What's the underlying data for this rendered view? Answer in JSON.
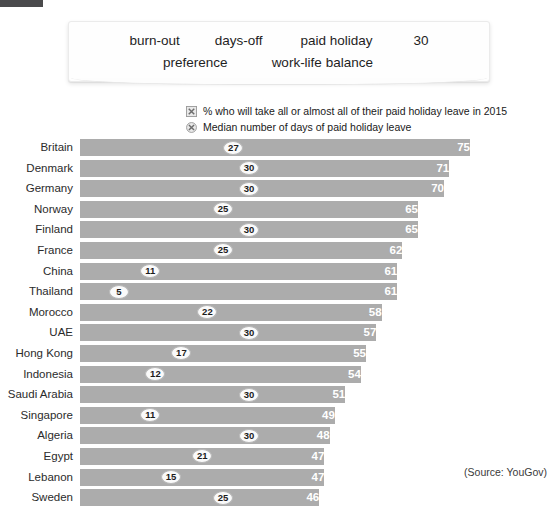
{
  "top_strip": {
    "color": "#4a4a4c"
  },
  "keyword_card": {
    "row1": [
      "burn-out",
      "days-off",
      "paid holiday",
      "30"
    ],
    "row2": [
      "preference",
      "work-life balance"
    ]
  },
  "legend": [
    {
      "marker": "broken-image-square-icon",
      "label": "% who will take all or almost all of their paid holiday leave in 2015"
    },
    {
      "marker": "broken-image-circle-icon",
      "label": "Median number of days of paid holiday leave"
    }
  ],
  "source": "(Source: YouGov)",
  "colors": {
    "bar": "#acacac",
    "bar_value_text": "#ffffff",
    "badge_fill": "#fafafa",
    "badge_border": "#b9b9b9"
  },
  "chart_data": {
    "type": "bar",
    "title": "",
    "xlabel": "",
    "ylabel": "",
    "orientation": "horizontal",
    "grid": false,
    "legend_position": "top-right",
    "xlim": [
      0,
      80
    ],
    "categories": [
      "Britain",
      "Denmark",
      "Germany",
      "Norway",
      "Finland",
      "France",
      "China",
      "Thailand",
      "Morocco",
      "UAE",
      "Hong Kong",
      "Indonesia",
      "Saudi Arabia",
      "Singapore",
      "Algeria",
      "Egypt",
      "Lebanon",
      "Sweden"
    ],
    "series": [
      {
        "name": "% who will take all or almost all of their paid holiday leave in 2015",
        "values": [
          75,
          71,
          70,
          65,
          65,
          62,
          61,
          61,
          58,
          57,
          55,
          54,
          51,
          49,
          48,
          47,
          47,
          46
        ]
      },
      {
        "name": "Median number of days of paid holiday leave",
        "values": [
          27,
          30,
          30,
          25,
          30,
          25,
          11,
          5,
          22,
          30,
          17,
          12,
          30,
          11,
          30,
          21,
          15,
          25
        ]
      }
    ]
  }
}
